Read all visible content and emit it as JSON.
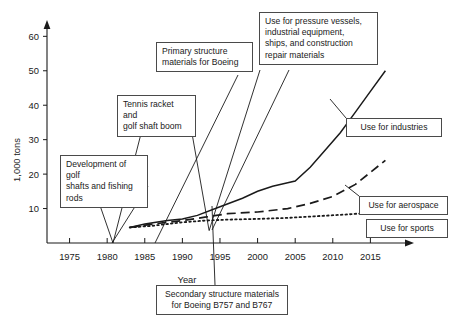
{
  "chart_data": {
    "type": "line",
    "title": "",
    "xlabel": "Year",
    "ylabel": "1,000 tons",
    "xlim": [
      1972,
      2020
    ],
    "ylim": [
      0,
      63
    ],
    "xticks": [
      1975,
      1980,
      1985,
      1990,
      1995,
      2000,
      2005,
      2010,
      2015
    ],
    "yticks": [
      10,
      20,
      30,
      40,
      50,
      60
    ],
    "grid": false,
    "legend_position": "inline-right-labels",
    "series": [
      {
        "name": "Use for industries",
        "style": "solid",
        "x": [
          1983,
          1985,
          1988,
          1990,
          1992,
          1995,
          1998,
          2000,
          2002,
          2004,
          2005,
          2007,
          2009,
          2011,
          2013,
          2015,
          2017
        ],
        "values": [
          4.5,
          5.5,
          6.5,
          7.0,
          8.0,
          10.5,
          13.0,
          15.0,
          16.5,
          17.5,
          18.0,
          22.0,
          27.0,
          32.0,
          38.0,
          44.0,
          50.0
        ]
      },
      {
        "name": "Use for aerospace",
        "style": "dashed",
        "x": [
          1983,
          1986,
          1990,
          1993,
          1996,
          2000,
          2004,
          2007,
          2010,
          2013,
          2015,
          2017
        ],
        "values": [
          4.5,
          5.5,
          6.5,
          7.5,
          8.5,
          9.0,
          10.0,
          11.5,
          13.5,
          17.0,
          20.5,
          24.0
        ]
      },
      {
        "name": "Use for sports",
        "style": "dotted",
        "x": [
          1983,
          1986,
          1990,
          1993,
          1996,
          2000,
          2004,
          2008,
          2012,
          2015,
          2017
        ],
        "values": [
          4.5,
          5.0,
          6.0,
          6.5,
          6.8,
          7.0,
          7.3,
          7.8,
          8.3,
          8.8,
          9.0
        ]
      }
    ],
    "annotations": [
      {
        "name": "development-of-golf-shafts",
        "text": "Development of golf\nshafts and fishing\nrods",
        "target_year": 1983,
        "target_value": 4.5
      },
      {
        "name": "tennis-racket-boom",
        "text": "Tennis racket and\ngolf shaft boom",
        "target_year": 1990,
        "target_value": 6.8
      },
      {
        "name": "primary-structure-materials-boeing",
        "text": "Primary structure\nmaterials for Boeing",
        "target_year": 1996,
        "target_value": 11.0
      },
      {
        "name": "secondary-structure-materials-boeing",
        "text": "Secondary structure materials\nfor Boeing B757 and B767",
        "target_year": 1991,
        "target_value": 4.6
      },
      {
        "name": "use-for-pressure-vessels",
        "text": "Use for pressure vessels,\nindustrial equipment,\nships, and construction\nrepair materials",
        "target_year": 2005,
        "target_value": 17.5
      }
    ],
    "inline_labels": [
      {
        "name": "use-for-industries",
        "text": "Use for industries"
      },
      {
        "name": "use-for-aerospace",
        "text": "Use for aerospace"
      },
      {
        "name": "use-for-sports",
        "text": "Use for sports"
      }
    ]
  },
  "axes": {
    "ylabel": "1,000 tons",
    "xlabel": "Year",
    "ytick_labels": [
      "60",
      "50",
      "40",
      "30",
      "20",
      "10"
    ],
    "xtick_labels": [
      "1975",
      "1980",
      "1985",
      "1990",
      "1995",
      "2000",
      "2005",
      "2010",
      "2015"
    ]
  },
  "callouts": {
    "golf_shafts": "Development of golf\nshafts and fishing\nrods",
    "tennis_racket": "Tennis racket and\ngolf shaft boom",
    "primary_structure": "Primary structure\nmaterials for Boeing",
    "pressure_vessels": "Use for pressure vessels,\nindustrial equipment,\nships, and construction\nrepair materials",
    "secondary_structure": "Secondary structure materials\nfor Boeing B757 and B767",
    "use_industries": "Use for industries",
    "use_aerospace": "Use for aerospace",
    "use_sports": "Use for sports"
  },
  "colors": {
    "line": "#1a1a1a",
    "box_border": "#4a4a4a",
    "text": "#1a1a1a",
    "background": "#ffffff"
  }
}
